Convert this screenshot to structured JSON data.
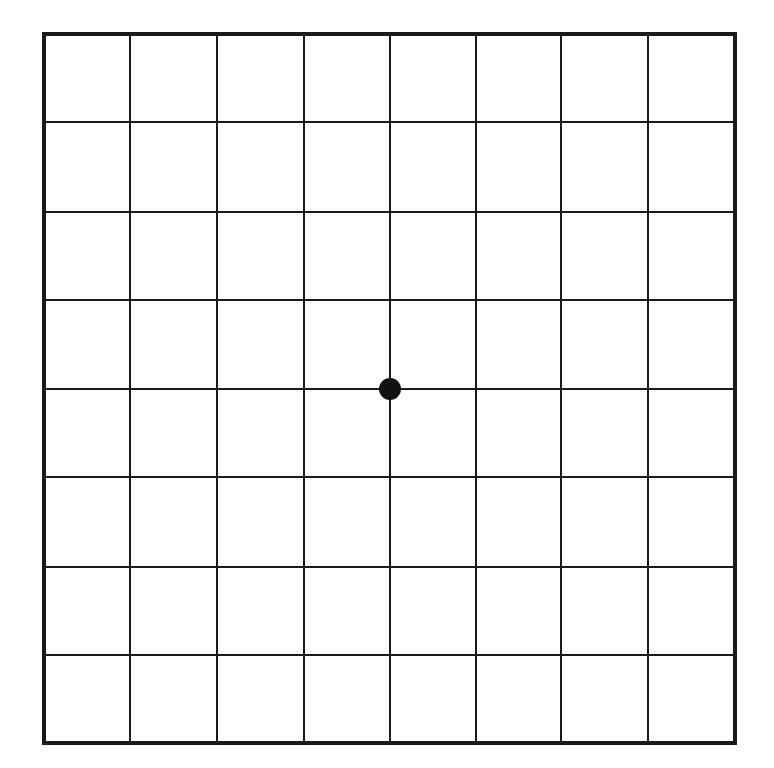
{
  "diagram": {
    "type": "amsler-grid",
    "rows": 8,
    "cols": 8,
    "border": {
      "x0": 44,
      "y0": 34,
      "x1": 735,
      "y1": 743,
      "width": 4
    },
    "line_width": 2,
    "line_color": "#1a1a1a",
    "background": "#ffffff",
    "center_dot": {
      "cx": 390,
      "cy": 389,
      "r": 11,
      "color": "#111111"
    },
    "col_lines": [
      130,
      217,
      304,
      390,
      476,
      561,
      648
    ],
    "row_lines": [
      122,
      212,
      300,
      389,
      477,
      567,
      655
    ]
  }
}
